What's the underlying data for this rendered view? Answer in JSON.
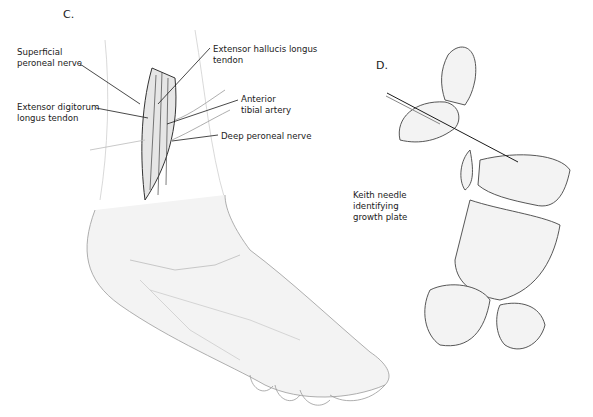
{
  "panels": [
    {
      "id": "C",
      "label": "C."
    },
    {
      "id": "D",
      "label": "D."
    }
  ],
  "labels": {
    "superficial_peroneal_nerve": "Superficial\nperoneal nerve",
    "extensor_hallucis_longus": "Extensor hallucis longus\ntendon",
    "extensor_digitorum_longus": "Extensor digitorum\nlongus tendon",
    "anterior_tibial_artery": "Anterior\ntibial artery",
    "deep_peroneal_nerve": "Deep peroneal nerve",
    "keith_needle": "Keith needle\nidentifying\ngrowth plate"
  },
  "colors": {
    "line": "#1a1a1a",
    "shade": "#d9d9d9",
    "light": "#efefef"
  }
}
